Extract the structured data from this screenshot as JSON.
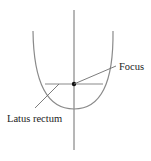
{
  "diagram": {
    "type": "parabola",
    "labels": {
      "focus": "Focus",
      "latus_rectum": "Latus rectum"
    },
    "colors": {
      "curve": "#8a8a8a",
      "lines": "#6e6e6e",
      "point": "#111111",
      "text": "#222222"
    }
  }
}
